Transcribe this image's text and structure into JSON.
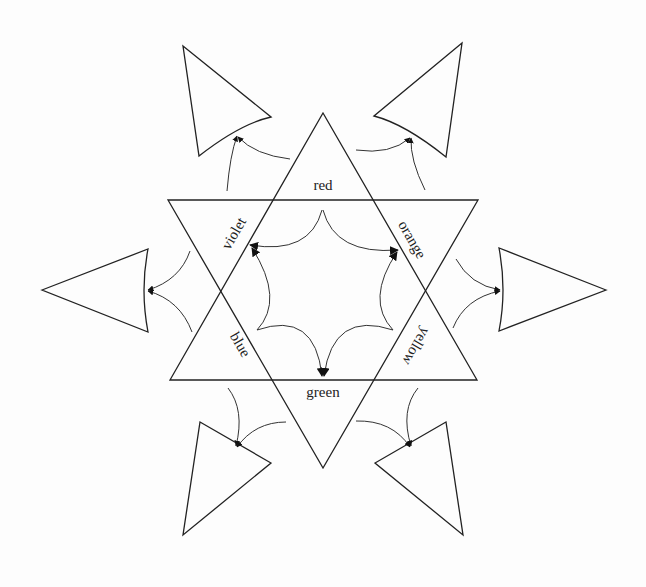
{
  "diagram": {
    "labels": {
      "red": "red",
      "orange": "orange",
      "yellow": "yellow",
      "green": "green",
      "blue": "blue",
      "violet": "violet"
    },
    "colors": {
      "stroke": "#222222",
      "background": "#fdfdfd"
    }
  }
}
